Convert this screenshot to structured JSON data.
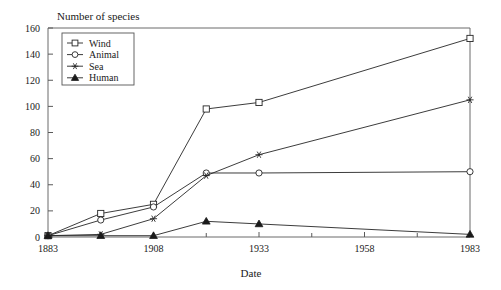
{
  "chart_data": {
    "type": "line",
    "title": "Number of species",
    "xlabel": "Date",
    "ylabel": "",
    "xlim": [
      1883,
      1983
    ],
    "ylim": [
      0,
      160
    ],
    "x_ticks": [
      1883,
      1908,
      1933,
      1958,
      1983
    ],
    "x_tick_labels": [
      "1883",
      "1908",
      "1933",
      "1958",
      "1983"
    ],
    "x_minor_ticks": [
      1895.5,
      1920.5,
      1945.5,
      1970.5
    ],
    "y_ticks": [
      0,
      20,
      40,
      60,
      80,
      100,
      120,
      140,
      160
    ],
    "y_tick_labels": [
      "0",
      "20",
      "40",
      "60",
      "80",
      "100",
      "120",
      "140",
      "160"
    ],
    "grid": false,
    "legend_position": "top-left",
    "x": [
      1883,
      1895.5,
      1908,
      1920.5,
      1933,
      1983
    ],
    "series": [
      {
        "name": "Wind",
        "marker": "open-square",
        "values": [
          1,
          18,
          25,
          98,
          103,
          152
        ]
      },
      {
        "name": "Animal",
        "marker": "open-circle",
        "values": [
          1,
          13,
          23,
          49,
          49,
          50
        ]
      },
      {
        "name": "Sea",
        "marker": "star",
        "values": [
          1,
          2,
          14,
          47,
          63,
          105
        ]
      },
      {
        "name": "Human",
        "marker": "filled-triangle",
        "values": [
          1,
          1,
          1,
          12,
          10,
          2
        ]
      }
    ]
  },
  "legend": {
    "items": [
      {
        "label": "Wind"
      },
      {
        "label": "Animal"
      },
      {
        "label": "Sea"
      },
      {
        "label": "Human"
      }
    ]
  },
  "colors": {
    "line": "#262626",
    "axis": "#5a5a5a",
    "text": "#1a1a1a",
    "background": "#ffffff"
  }
}
